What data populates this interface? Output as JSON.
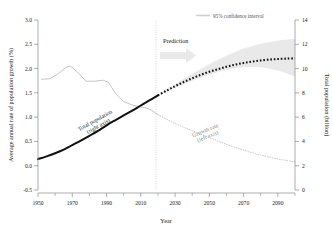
{
  "chart_data": {
    "type": "line",
    "title": "",
    "xlabel": "Year",
    "ylabel_left": "Average annual rate of population growth (%)",
    "ylabel_right": "Total population (billion)",
    "xlim": [
      1950,
      2100
    ],
    "ylim_left": [
      -0.5,
      3.0
    ],
    "ylim_right": [
      0,
      14
    ],
    "grid": false,
    "legend_position": "top-right",
    "x_ticks_major": [
      1950,
      1970,
      1990,
      2010,
      2030,
      2050,
      2070,
      2090
    ],
    "x_ticks_minor": [
      1960,
      1980,
      2000,
      2020,
      2040,
      2060,
      2080,
      2100
    ],
    "y_ticks_left": [
      -0.5,
      0.0,
      0.5,
      1.0,
      1.5,
      2.0,
      2.5,
      3.0
    ],
    "y_ticks_right": [
      0,
      2,
      4,
      6,
      8,
      10,
      12,
      14
    ],
    "prediction_start_year": 2020,
    "series": [
      {
        "name": "Total population (right axis) — historical",
        "axis": "right",
        "style": "solid-thick-black",
        "color": "#111111",
        "x": [
          1950,
          1955,
          1960,
          1965,
          1970,
          1975,
          1980,
          1985,
          1990,
          1995,
          2000,
          2005,
          2010,
          2015,
          2020
        ],
        "values": [
          2.54,
          2.77,
          3.03,
          3.33,
          3.7,
          4.07,
          4.46,
          4.87,
          5.33,
          5.74,
          6.14,
          6.54,
          6.96,
          7.38,
          7.79
        ]
      },
      {
        "name": "Total population (right axis) — projection",
        "axis": "right",
        "style": "dotted-thick-black",
        "color": "#111111",
        "x": [
          2020,
          2025,
          2030,
          2035,
          2040,
          2045,
          2050,
          2055,
          2060,
          2065,
          2070,
          2075,
          2080,
          2085,
          2090,
          2095,
          2100
        ],
        "values": [
          7.79,
          8.18,
          8.55,
          8.89,
          9.2,
          9.48,
          9.74,
          9.95,
          10.15,
          10.32,
          10.46,
          10.58,
          10.67,
          10.74,
          10.79,
          10.82,
          10.84
        ]
      },
      {
        "name": "Growth rate (left axis) — historical",
        "axis": "left",
        "style": "solid-thin-gray",
        "color": "#b5b5b5",
        "x": [
          1952,
          1957,
          1962,
          1967,
          1969,
          1973,
          1978,
          1983,
          1988,
          1991,
          1995,
          2000,
          2005,
          2010,
          2013,
          2016,
          2020
        ],
        "values": [
          1.78,
          1.79,
          1.9,
          2.04,
          2.05,
          1.93,
          1.74,
          1.74,
          1.76,
          1.72,
          1.5,
          1.32,
          1.25,
          1.21,
          1.19,
          1.15,
          1.05
        ]
      },
      {
        "name": "Growth rate (left axis) — projection",
        "axis": "left",
        "style": "dotted-thin-gray",
        "color": "#b5b5b5",
        "x": [
          2020,
          2030,
          2040,
          2050,
          2060,
          2070,
          2080,
          2090,
          2100
        ],
        "values": [
          1.05,
          0.87,
          0.72,
          0.58,
          0.44,
          0.32,
          0.22,
          0.14,
          0.08
        ]
      }
    ],
    "confidence_band": {
      "label": "95% confidence interval",
      "axis": "right",
      "color": "#e4e4e4",
      "x": [
        2020,
        2030,
        2040,
        2050,
        2060,
        2070,
        2080,
        2090,
        2100
      ],
      "upper": [
        7.79,
        8.7,
        9.55,
        10.35,
        11.05,
        11.65,
        12.05,
        12.3,
        12.45
      ],
      "lower": [
        7.79,
        8.42,
        9.0,
        9.5,
        9.88,
        10.1,
        10.1,
        9.85,
        9.35
      ]
    },
    "annotations": [
      {
        "name": "total-population-annotation",
        "line1": "Total population",
        "line2": "(right axis)",
        "rotation": -29
      },
      {
        "name": "growth-rate-annotation",
        "line1": "Growth rate",
        "line2": "(left axis)",
        "rotation": -22
      },
      {
        "name": "prediction-annotation",
        "text": "Prediction"
      }
    ]
  },
  "axes": {
    "x_title": "Year",
    "y_left_title": "Average annual rate of population growth (%)",
    "y_right_title": "Total population (billion)",
    "x_tick_labels": [
      "1950",
      "1970",
      "1990",
      "2010",
      "2030",
      "2050",
      "2070",
      "2090"
    ],
    "y_left_tick_labels": [
      "3.0",
      "2.5",
      "2.0",
      "1.5",
      "1.0",
      "0.5",
      "0.0",
      "-0.5"
    ],
    "y_right_tick_labels": [
      "14",
      "12",
      "10",
      "8",
      "6",
      "4",
      "2",
      "0"
    ]
  },
  "legend": {
    "ci_label": "95% confidence interval"
  },
  "labels": {
    "prediction": "Prediction",
    "total_population_l1": "Total population",
    "total_population_l2": "(right axis)",
    "growth_rate_l1": "Growth rate",
    "growth_rate_l2": "(left axis)"
  },
  "colors": {
    "population_line": "#111111",
    "growth_line": "#b5b5b5",
    "confidence_band": "#e4e4e4",
    "axis": "#7a7a7a",
    "prediction_arrow": "#e8e8e8"
  }
}
